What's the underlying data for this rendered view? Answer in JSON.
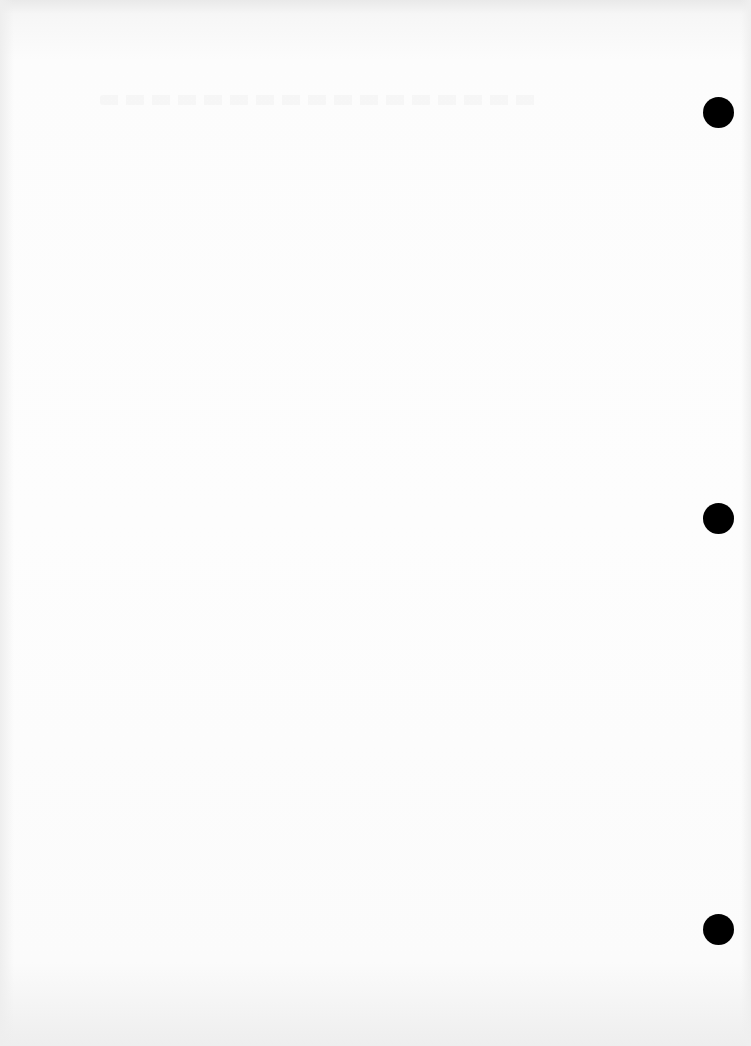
{
  "document": {
    "type": "blank scanned sheet",
    "background_color": "#fcfcfc",
    "text_content": "",
    "punch_holes": [
      {
        "position": "top",
        "color": "#000000"
      },
      {
        "position": "middle",
        "color": "#000000"
      },
      {
        "position": "bottom",
        "color": "#000000"
      }
    ]
  }
}
